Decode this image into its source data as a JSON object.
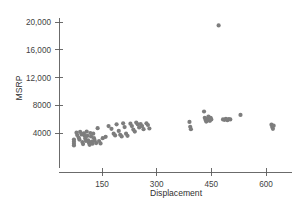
{
  "chart_data": {
    "type": "scatter",
    "title": "",
    "xlabel": "Displacement",
    "ylabel": "MSRP",
    "xlim": [
      60,
      690
    ],
    "ylim": [
      1200,
      21200
    ],
    "xticks": [
      150,
      300,
      450,
      600
    ],
    "xtick_labels": [
      "150",
      "300",
      "450",
      "600"
    ],
    "yticks": [
      4000,
      8000,
      12000,
      16000,
      20000
    ],
    "ytick_labels": [
      "4000",
      "8000",
      "12,000",
      "16,000",
      "20,000"
    ],
    "grid": false,
    "legend": "none",
    "marker_color": "#7d7d7d",
    "marker_size": 2.1,
    "points": [
      [
        73,
        3050
      ],
      [
        73,
        2750
      ],
      [
        73,
        2450
      ],
      [
        73,
        2200
      ],
      [
        80,
        4050
      ],
      [
        82,
        3700
      ],
      [
        86,
        3350
      ],
      [
        88,
        3050
      ],
      [
        90,
        4150
      ],
      [
        94,
        3800
      ],
      [
        96,
        2700
      ],
      [
        98,
        2400
      ],
      [
        100,
        3950
      ],
      [
        102,
        3600
      ],
      [
        104,
        3200
      ],
      [
        106,
        2850
      ],
      [
        108,
        4200
      ],
      [
        110,
        3600
      ],
      [
        112,
        2950
      ],
      [
        114,
        2600
      ],
      [
        116,
        2300
      ],
      [
        118,
        4000
      ],
      [
        120,
        3500
      ],
      [
        122,
        2750
      ],
      [
        124,
        2450
      ],
      [
        126,
        3900
      ],
      [
        128,
        3250
      ],
      [
        130,
        2900
      ],
      [
        134,
        2550
      ],
      [
        138,
        4700
      ],
      [
        142,
        2850
      ],
      [
        146,
        2500
      ],
      [
        152,
        3250
      ],
      [
        160,
        3450
      ],
      [
        168,
        5000
      ],
      [
        176,
        4600
      ],
      [
        182,
        3900
      ],
      [
        186,
        3650
      ],
      [
        190,
        5250
      ],
      [
        196,
        4300
      ],
      [
        200,
        3750
      ],
      [
        204,
        3500
      ],
      [
        208,
        5400
      ],
      [
        212,
        4850
      ],
      [
        216,
        3900
      ],
      [
        220,
        3600
      ],
      [
        228,
        5350
      ],
      [
        232,
        5000
      ],
      [
        236,
        4500
      ],
      [
        240,
        4200
      ],
      [
        244,
        5500
      ],
      [
        248,
        5250
      ],
      [
        252,
        4800
      ],
      [
        256,
        5300
      ],
      [
        260,
        5000
      ],
      [
        264,
        4550
      ],
      [
        272,
        5400
      ],
      [
        276,
        5150
      ],
      [
        280,
        4650
      ],
      [
        390,
        5600
      ],
      [
        392,
        4900
      ],
      [
        394,
        4550
      ],
      [
        430,
        7100
      ],
      [
        432,
        6200
      ],
      [
        434,
        5900
      ],
      [
        436,
        5650
      ],
      [
        438,
        6050
      ],
      [
        440,
        5800
      ],
      [
        442,
        6350
      ],
      [
        444,
        6000
      ],
      [
        446,
        5750
      ],
      [
        448,
        6200
      ],
      [
        450,
        5950
      ],
      [
        470,
        19500
      ],
      [
        482,
        5950
      ],
      [
        486,
        5900
      ],
      [
        490,
        6050
      ],
      [
        494,
        5850
      ],
      [
        498,
        6000
      ],
      [
        502,
        5950
      ],
      [
        530,
        6600
      ],
      [
        615,
        5200
      ],
      [
        617,
        4850
      ],
      [
        619,
        4600
      ],
      [
        621,
        5050
      ]
    ]
  }
}
